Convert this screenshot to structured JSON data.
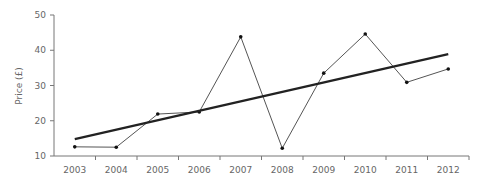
{
  "chart_data": {
    "type": "line",
    "title": "",
    "xlabel": "",
    "ylabel": "Price (£)",
    "ylim": [
      10,
      50
    ],
    "yticks": [
      10,
      20,
      30,
      40,
      50
    ],
    "grid": false,
    "legend": null,
    "categories": [
      "2003",
      "2004",
      "2005",
      "2006",
      "2007",
      "2008",
      "2009",
      "2010",
      "2011",
      "2012"
    ],
    "series": [
      {
        "name": "Price",
        "style": "thin line with point markers",
        "color": "#555555",
        "values": [
          12.6,
          12.5,
          21.9,
          22.5,
          43.8,
          12.2,
          33.5,
          44.6,
          30.9,
          34.7
        ]
      },
      {
        "name": "Linear trend",
        "style": "thick line",
        "color": "#222222",
        "values": [
          14.8,
          17.5,
          20.2,
          22.8,
          25.5,
          28.2,
          30.9,
          33.5,
          36.2,
          38.9
        ]
      }
    ]
  }
}
